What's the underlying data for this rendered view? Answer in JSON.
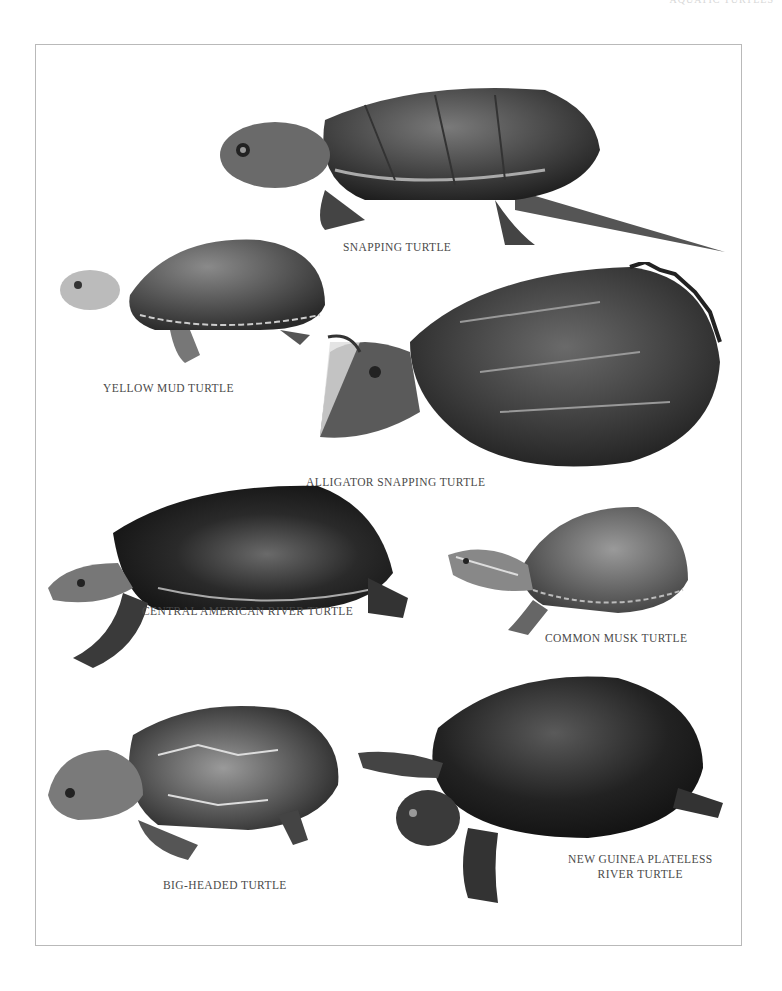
{
  "page": {
    "running_head": "AQUATIC TURTLES"
  },
  "plate": {
    "specimens": [
      {
        "id": "snapping",
        "label": "SNAPPING TURTLE"
      },
      {
        "id": "yellow-mud",
        "label": "YELLOW MUD TURTLE"
      },
      {
        "id": "alligator-snapping",
        "label": "ALLIGATOR SNAPPING TURTLE"
      },
      {
        "id": "central-american-river",
        "label": "CENTRAL AMERICAN RIVER TURTLE"
      },
      {
        "id": "common-musk",
        "label": "COMMON MUSK TURTLE"
      },
      {
        "id": "big-headed",
        "label": "BIG-HEADED TURTLE"
      },
      {
        "id": "new-guinea-plateless",
        "label_line1": "NEW GUINEA PLATELESS",
        "label_line2": "RIVER TURTLE"
      }
    ]
  },
  "colors": {
    "frame": "#b9b9b9",
    "caption": "#4a4a4a",
    "shell_dark": "#2a2a2a",
    "shell_mid": "#5a5a5a",
    "skin": "#8a8a8a"
  }
}
